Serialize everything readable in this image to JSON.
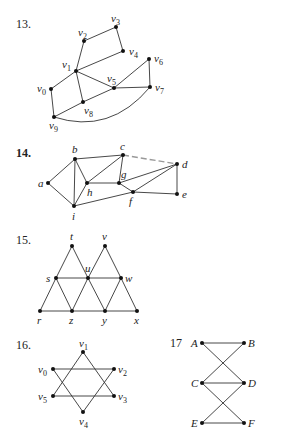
{
  "exercises": [
    {
      "number": "13.",
      "bold": false,
      "nodes": [
        {
          "id": "v0",
          "label": "v0",
          "x": 51,
          "y": 89,
          "lx": 37,
          "ly": 92
        },
        {
          "id": "v1",
          "label": "v1",
          "x": 76,
          "y": 71,
          "lx": 62,
          "ly": 68
        },
        {
          "id": "v2",
          "label": "v2",
          "x": 84,
          "y": 41,
          "lx": 78,
          "ly": 36
        },
        {
          "id": "v3",
          "label": "v3",
          "x": 116,
          "y": 27,
          "lx": 111,
          "ly": 22
        },
        {
          "id": "v4",
          "label": "v4",
          "x": 123,
          "y": 51,
          "lx": 129,
          "ly": 55
        },
        {
          "id": "v5",
          "label": "v5",
          "x": 114,
          "y": 88,
          "lx": 107,
          "ly": 82
        },
        {
          "id": "v6",
          "label": "v6",
          "x": 149,
          "y": 59,
          "lx": 154,
          "ly": 62
        },
        {
          "id": "v7",
          "label": "v7",
          "x": 150,
          "y": 87,
          "lx": 155,
          "ly": 91
        },
        {
          "id": "v8",
          "label": "v8",
          "x": 83,
          "y": 102,
          "lx": 84,
          "ly": 114
        },
        {
          "id": "v9",
          "label": "v9",
          "x": 54,
          "y": 117,
          "lx": 49,
          "ly": 129
        }
      ],
      "edges": [
        [
          "v1",
          "v2"
        ],
        [
          "v2",
          "v3"
        ],
        [
          "v3",
          "v4"
        ],
        [
          "v1",
          "v4"
        ],
        [
          "v1",
          "v5"
        ],
        [
          "v5",
          "v6"
        ],
        [
          "v6",
          "v7"
        ],
        [
          "v5",
          "v7"
        ],
        [
          "v1",
          "v0"
        ],
        [
          "v1",
          "v8"
        ],
        [
          "v0",
          "v9"
        ],
        [
          "v9",
          "v8"
        ],
        [
          "v8",
          "v5"
        ]
      ],
      "curved_edges": [
        {
          "from": "v9",
          "to": "v7",
          "cx": 110,
          "cy": 135
        }
      ],
      "faint_edges": []
    },
    {
      "number": "14.",
      "bold": true,
      "nodes": [
        {
          "id": "a",
          "label": "a",
          "x": 48,
          "y": 183,
          "lx": 38,
          "ly": 187
        },
        {
          "id": "b",
          "label": "b",
          "x": 75,
          "y": 159,
          "lx": 72,
          "ly": 153
        },
        {
          "id": "c",
          "label": "c",
          "x": 123,
          "y": 155,
          "lx": 120,
          "ly": 150
        },
        {
          "id": "d",
          "label": "d",
          "x": 177,
          "y": 164,
          "lx": 182,
          "ly": 168
        },
        {
          "id": "e",
          "label": "e",
          "x": 177,
          "y": 194,
          "lx": 182,
          "ly": 198
        },
        {
          "id": "f",
          "label": "f",
          "x": 133,
          "y": 192,
          "lx": 129,
          "ly": 205
        },
        {
          "id": "g",
          "label": "g",
          "x": 119,
          "y": 183,
          "lx": 121,
          "ly": 178
        },
        {
          "id": "h",
          "label": "h",
          "x": 87,
          "y": 183,
          "lx": 87,
          "ly": 196
        },
        {
          "id": "i",
          "label": "i",
          "x": 74,
          "y": 206,
          "lx": 72,
          "ly": 220
        }
      ],
      "edges": [
        [
          "a",
          "b"
        ],
        [
          "a",
          "i"
        ],
        [
          "b",
          "c"
        ],
        [
          "b",
          "h"
        ],
        [
          "b",
          "i"
        ],
        [
          "h",
          "i"
        ],
        [
          "h",
          "c"
        ],
        [
          "h",
          "g"
        ],
        [
          "c",
          "g"
        ],
        [
          "g",
          "d"
        ],
        [
          "g",
          "f"
        ],
        [
          "f",
          "d"
        ],
        [
          "f",
          "e"
        ],
        [
          "d",
          "e"
        ],
        [
          "i",
          "f"
        ]
      ],
      "curved_edges": [],
      "faint_edges": [
        [
          "c",
          "d"
        ]
      ]
    },
    {
      "number": "15.",
      "bold": false,
      "nodes": [
        {
          "id": "t",
          "label": "t",
          "x": 72,
          "y": 246,
          "lx": 70,
          "ly": 240
        },
        {
          "id": "v",
          "label": "v",
          "x": 105,
          "y": 246,
          "lx": 102,
          "ly": 240
        },
        {
          "id": "s",
          "label": "s",
          "x": 56,
          "y": 278,
          "lx": 46,
          "ly": 282
        },
        {
          "id": "u",
          "label": "u",
          "x": 88,
          "y": 278,
          "lx": 85,
          "ly": 272
        },
        {
          "id": "w",
          "label": "w",
          "x": 121,
          "y": 278,
          "lx": 125,
          "ly": 282
        },
        {
          "id": "r",
          "label": "r",
          "x": 40,
          "y": 311,
          "lx": 37,
          "ly": 324
        },
        {
          "id": "z",
          "label": "z",
          "x": 72,
          "y": 311,
          "lx": 69,
          "ly": 324
        },
        {
          "id": "y",
          "label": "y",
          "x": 105,
          "y": 311,
          "lx": 102,
          "ly": 324
        },
        {
          "id": "x",
          "label": "x",
          "x": 137,
          "y": 311,
          "lx": 134,
          "ly": 324
        }
      ],
      "edges": [
        [
          "t",
          "s"
        ],
        [
          "t",
          "u"
        ],
        [
          "v",
          "u"
        ],
        [
          "v",
          "w"
        ],
        [
          "s",
          "u"
        ],
        [
          "u",
          "w"
        ],
        [
          "s",
          "r"
        ],
        [
          "s",
          "z"
        ],
        [
          "u",
          "z"
        ],
        [
          "u",
          "y"
        ],
        [
          "w",
          "y"
        ],
        [
          "w",
          "x"
        ],
        [
          "r",
          "z"
        ],
        [
          "z",
          "y"
        ],
        [
          "y",
          "x"
        ]
      ],
      "curved_edges": [],
      "faint_edges": []
    },
    {
      "number": "16.",
      "bold": false,
      "nodes": [
        {
          "id": "v1",
          "label": "v1",
          "x": 83,
          "y": 352,
          "lx": 79,
          "ly": 347
        },
        {
          "id": "v0",
          "label": "v0",
          "x": 53,
          "y": 369,
          "lx": 38,
          "ly": 373
        },
        {
          "id": "v2",
          "label": "v2",
          "x": 114,
          "y": 369,
          "lx": 118,
          "ly": 373
        },
        {
          "id": "v5",
          "label": "v5",
          "x": 53,
          "y": 396,
          "lx": 38,
          "ly": 400
        },
        {
          "id": "v3",
          "label": "v3",
          "x": 114,
          "y": 396,
          "lx": 118,
          "ly": 400
        },
        {
          "id": "v4",
          "label": "v4",
          "x": 83,
          "y": 412,
          "lx": 79,
          "ly": 425
        }
      ],
      "edges": [
        [
          "v1",
          "v5"
        ],
        [
          "v1",
          "v3"
        ],
        [
          "v5",
          "v3"
        ],
        [
          "v0",
          "v2"
        ],
        [
          "v0",
          "v4"
        ],
        [
          "v2",
          "v4"
        ]
      ],
      "curved_edges": [],
      "faint_edges": []
    },
    {
      "number": "17",
      "bold": false,
      "nodes": [
        {
          "id": "A",
          "label": "A",
          "x": 202,
          "y": 343,
          "lx": 191,
          "ly": 347
        },
        {
          "id": "B",
          "label": "B",
          "x": 244,
          "y": 343,
          "lx": 248,
          "ly": 347
        },
        {
          "id": "C",
          "label": "C",
          "x": 202,
          "y": 383,
          "lx": 191,
          "ly": 387
        },
        {
          "id": "D",
          "label": "D",
          "x": 244,
          "y": 383,
          "lx": 248,
          "ly": 387
        },
        {
          "id": "E",
          "label": "E",
          "x": 202,
          "y": 423,
          "lx": 191,
          "ly": 427
        },
        {
          "id": "F",
          "label": "F",
          "x": 244,
          "y": 423,
          "lx": 248,
          "ly": 427
        }
      ],
      "edges": [
        [
          "A",
          "B"
        ],
        [
          "A",
          "D"
        ],
        [
          "B",
          "C"
        ],
        [
          "C",
          "D"
        ],
        [
          "C",
          "F"
        ],
        [
          "D",
          "E"
        ],
        [
          "E",
          "F"
        ]
      ],
      "curved_edges": [],
      "faint_edges": []
    }
  ],
  "number_positions": [
    {
      "x": 16,
      "y": 28
    },
    {
      "x": 16,
      "y": 157
    },
    {
      "x": 16,
      "y": 244
    },
    {
      "x": 16,
      "y": 349
    },
    {
      "x": 170,
      "y": 347
    }
  ]
}
